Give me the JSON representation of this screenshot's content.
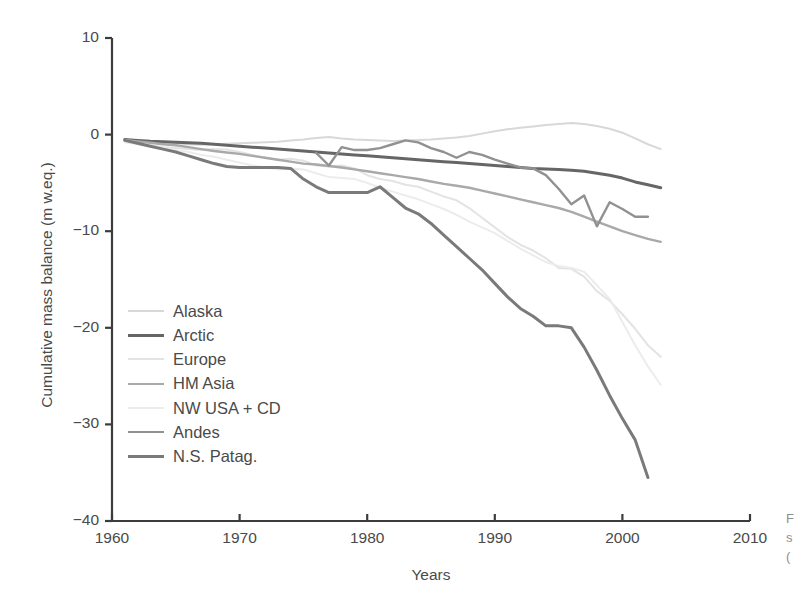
{
  "chart_data": {
    "type": "line",
    "title": "",
    "xlabel": "Years",
    "ylabel": "Cumulative mass balance (m w.eq.)",
    "xlim": [
      1960,
      2010
    ],
    "ylim": [
      -40,
      10
    ],
    "xticks": [
      1960,
      1970,
      1980,
      1990,
      2000,
      2010
    ],
    "yticks": [
      10,
      0,
      -10,
      -20,
      -30,
      -40
    ],
    "xtick_labels": [
      "1960",
      "1970",
      "1980",
      "1990",
      "2000",
      "2010"
    ],
    "ytick_labels": [
      "10",
      "0",
      "−10",
      "−20",
      "−30",
      "−40"
    ],
    "grid": false,
    "legend_position": "lower left inside axes",
    "series": [
      {
        "name": "Alaska",
        "color": "#d8d8d8",
        "width": 2.0,
        "x": [
          1961,
          1962,
          1963,
          1964,
          1965,
          1966,
          1967,
          1968,
          1969,
          1970,
          1971,
          1972,
          1973,
          1974,
          1975,
          1976,
          1977,
          1978,
          1979,
          1980,
          1981,
          1982,
          1983,
          1984,
          1985,
          1986,
          1987,
          1988,
          1989,
          1990,
          1991,
          1992,
          1993,
          1994,
          1995,
          1996,
          1997,
          1998,
          1999,
          2000,
          2001,
          2002,
          2003
        ],
        "values": [
          -0.6,
          -0.7,
          -0.8,
          -0.85,
          -0.9,
          -1.0,
          -1.05,
          -1.0,
          -0.95,
          -0.9,
          -0.85,
          -0.8,
          -0.75,
          -0.6,
          -0.5,
          -0.35,
          -0.25,
          -0.4,
          -0.5,
          -0.55,
          -0.6,
          -0.65,
          -0.6,
          -0.55,
          -0.5,
          -0.4,
          -0.3,
          -0.15,
          0.1,
          0.35,
          0.55,
          0.7,
          0.85,
          1.0,
          1.1,
          1.2,
          1.1,
          0.9,
          0.6,
          0.2,
          -0.4,
          -1.0,
          -1.5
        ]
      },
      {
        "name": "Arctic",
        "color": "#666666",
        "width": 3.0,
        "x": [
          1961,
          1962,
          1963,
          1964,
          1965,
          1966,
          1967,
          1968,
          1969,
          1970,
          1971,
          1972,
          1973,
          1974,
          1975,
          1976,
          1977,
          1978,
          1979,
          1980,
          1981,
          1982,
          1983,
          1984,
          1985,
          1986,
          1987,
          1988,
          1989,
          1990,
          1991,
          1992,
          1993,
          1994,
          1995,
          1996,
          1997,
          1998,
          1999,
          2000,
          2001,
          2002,
          2003
        ],
        "values": [
          -0.5,
          -0.6,
          -0.7,
          -0.75,
          -0.8,
          -0.85,
          -0.9,
          -1.0,
          -1.1,
          -1.2,
          -1.3,
          -1.4,
          -1.5,
          -1.6,
          -1.7,
          -1.8,
          -1.9,
          -2.0,
          -2.1,
          -2.2,
          -2.3,
          -2.4,
          -2.5,
          -2.6,
          -2.7,
          -2.8,
          -2.9,
          -3.0,
          -3.1,
          -3.2,
          -3.3,
          -3.4,
          -3.5,
          -3.55,
          -3.6,
          -3.7,
          -3.8,
          -4.0,
          -4.2,
          -4.5,
          -4.9,
          -5.2,
          -5.5
        ]
      },
      {
        "name": "Europe",
        "color": "#e3e3e3",
        "width": 2.0,
        "x": [
          1961,
          1962,
          1963,
          1964,
          1965,
          1966,
          1967,
          1968,
          1969,
          1970,
          1971,
          1972,
          1973,
          1974,
          1975,
          1976,
          1977,
          1978,
          1979,
          1980,
          1981,
          1982,
          1983,
          1984,
          1985,
          1986,
          1987,
          1988,
          1989,
          1990,
          1991,
          1992,
          1993,
          1994,
          1995,
          1996,
          1997,
          1998,
          1999,
          2000,
          2001,
          2002,
          2003
        ],
        "values": [
          -0.7,
          -0.9,
          -1.1,
          -1.3,
          -1.4,
          -1.5,
          -1.6,
          -1.5,
          -1.55,
          -1.8,
          -2.1,
          -2.4,
          -2.6,
          -2.5,
          -2.7,
          -3.2,
          -3.3,
          -3.2,
          -3.5,
          -4.2,
          -4.6,
          -4.8,
          -5.2,
          -5.4,
          -5.9,
          -6.4,
          -6.8,
          -7.6,
          -8.6,
          -9.6,
          -10.6,
          -11.4,
          -12.0,
          -12.8,
          -13.8,
          -13.9,
          -14.7,
          -16.2,
          -17.2,
          -18.6,
          -20.1,
          -21.8,
          -23.0
        ]
      },
      {
        "name": "HM Asia",
        "color": "#a9a9a9",
        "width": 2.4,
        "x": [
          1961,
          1962,
          1963,
          1964,
          1965,
          1966,
          1967,
          1968,
          1969,
          1970,
          1971,
          1972,
          1973,
          1974,
          1975,
          1976,
          1977,
          1978,
          1979,
          1980,
          1981,
          1982,
          1983,
          1984,
          1985,
          1986,
          1987,
          1988,
          1989,
          1990,
          1991,
          1992,
          1993,
          1994,
          1995,
          1996,
          1997,
          1998,
          1999,
          2000,
          2001,
          2002,
          2003
        ],
        "values": [
          -0.55,
          -0.7,
          -0.85,
          -1.0,
          -1.1,
          -1.3,
          -1.5,
          -1.7,
          -1.85,
          -2.0,
          -2.2,
          -2.4,
          -2.6,
          -2.8,
          -3.0,
          -3.1,
          -3.25,
          -3.4,
          -3.6,
          -3.8,
          -4.0,
          -4.2,
          -4.4,
          -4.6,
          -4.85,
          -5.1,
          -5.3,
          -5.5,
          -5.8,
          -6.1,
          -6.4,
          -6.7,
          -7.0,
          -7.3,
          -7.6,
          -8.0,
          -8.5,
          -9.0,
          -9.5,
          -10.0,
          -10.4,
          -10.8,
          -11.1
        ]
      },
      {
        "name": "NW USA + CD",
        "color": "#ececec",
        "width": 2.0,
        "x": [
          1961,
          1962,
          1963,
          1964,
          1965,
          1966,
          1967,
          1968,
          1969,
          1970,
          1971,
          1972,
          1973,
          1974,
          1975,
          1976,
          1977,
          1978,
          1979,
          1980,
          1981,
          1982,
          1983,
          1984,
          1985,
          1986,
          1987,
          1988,
          1989,
          1990,
          1991,
          1992,
          1993,
          1994,
          1995,
          1996,
          1997,
          1998,
          1999,
          2000,
          2001,
          2002,
          2003
        ],
        "values": [
          -0.8,
          -1.0,
          -1.2,
          -1.4,
          -1.6,
          -1.8,
          -2.1,
          -2.3,
          -2.6,
          -2.9,
          -3.2,
          -3.4,
          -3.6,
          -3.5,
          -3.6,
          -4.0,
          -4.4,
          -4.5,
          -4.6,
          -5.0,
          -5.5,
          -5.9,
          -6.3,
          -6.7,
          -7.2,
          -7.7,
          -8.3,
          -9.0,
          -9.6,
          -10.2,
          -11.0,
          -11.8,
          -12.5,
          -13.2,
          -13.6,
          -13.8,
          -14.2,
          -15.6,
          -17.0,
          -19.4,
          -21.8,
          -24.0,
          -25.9
        ]
      },
      {
        "name": "Andes",
        "color": "#919191",
        "width": 2.4,
        "x": [
          1976,
          1977,
          1978,
          1979,
          1980,
          1981,
          1982,
          1983,
          1984,
          1985,
          1986,
          1987,
          1988,
          1989,
          1990,
          1991,
          1992,
          1993,
          1994,
          1995,
          1996,
          1997,
          1998,
          1999,
          2000,
          2001,
          2002
        ],
        "values": [
          -1.9,
          -3.2,
          -1.3,
          -1.6,
          -1.6,
          -1.4,
          -1.0,
          -0.6,
          -0.8,
          -1.4,
          -1.8,
          -2.4,
          -1.8,
          -2.1,
          -2.6,
          -3.0,
          -3.4,
          -3.5,
          -4.2,
          -5.6,
          -7.2,
          -6.3,
          -9.5,
          -7.0,
          -7.7,
          -8.5,
          -8.5
        ]
      },
      {
        "name": "N.S. Patag.",
        "color": "#7a7a7a",
        "width": 3.0,
        "x": [
          1961,
          1962,
          1963,
          1964,
          1965,
          1966,
          1967,
          1968,
          1969,
          1970,
          1971,
          1972,
          1973,
          1974,
          1975,
          1976,
          1977,
          1978,
          1979,
          1980,
          1981,
          1982,
          1983,
          1984,
          1985,
          1986,
          1987,
          1988,
          1989,
          1990,
          1991,
          1992,
          1993,
          1994,
          1995,
          1996,
          1997,
          1998,
          1999,
          2000,
          2001,
          2002
        ],
        "values": [
          -0.6,
          -0.9,
          -1.2,
          -1.5,
          -1.8,
          -2.2,
          -2.6,
          -3.0,
          -3.3,
          -3.4,
          -3.4,
          -3.4,
          -3.4,
          -3.5,
          -4.6,
          -5.4,
          -6.0,
          -6.0,
          -6.0,
          -6.0,
          -5.4,
          -6.5,
          -7.6,
          -8.2,
          -9.2,
          -10.4,
          -11.6,
          -12.8,
          -14.0,
          -15.4,
          -16.8,
          -18.0,
          -18.8,
          -19.8,
          -19.8,
          -20.0,
          -22.0,
          -24.4,
          -27.0,
          -29.4,
          -31.6,
          -35.5
        ]
      }
    ]
  },
  "caption_fragment": {
    "line1": "F",
    "line2": "s",
    "line3": "("
  }
}
